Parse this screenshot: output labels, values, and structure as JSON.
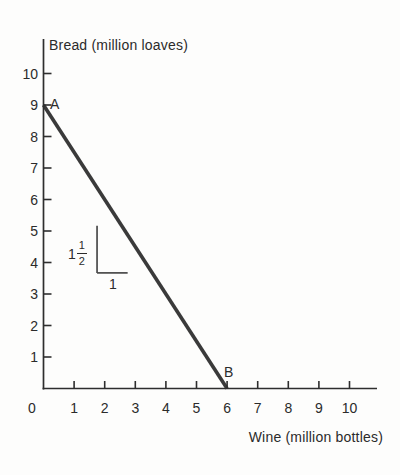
{
  "figure": {
    "background": "#fdfdfc",
    "axis_color": "#2e2e2e",
    "text_color": "#2b2b2b"
  },
  "chart_data": {
    "type": "line",
    "title": "",
    "xlabel": "Wine (million bottles)",
    "ylabel": "Bread (million loaves)",
    "xlim": [
      0,
      10.9
    ],
    "ylim": [
      0,
      11.1
    ],
    "x_ticks": [
      0,
      1,
      2,
      3,
      4,
      5,
      6,
      7,
      8,
      9,
      10
    ],
    "y_ticks": [
      1,
      2,
      3,
      4,
      5,
      6,
      7,
      8,
      9,
      10
    ],
    "grid": false,
    "legend": "none",
    "series": [
      {
        "name": "production-possibilities-frontier",
        "points": [
          [
            0,
            9
          ],
          [
            6,
            0
          ]
        ],
        "color": "#3a3a3a",
        "stroke_width": 3.6
      }
    ],
    "point_labels": [
      {
        "text": "A",
        "x": 0,
        "y": 9
      },
      {
        "text": "B",
        "x": 6,
        "y": 0
      }
    ],
    "slope_annotation": {
      "rise_text_whole": "1",
      "rise_text_numerator": "1",
      "rise_text_denominator": "2",
      "run_text": "1",
      "rise": 1.5,
      "run": 1,
      "corner": [
        1.75,
        3.67
      ],
      "color": "#4a4a4a"
    }
  }
}
